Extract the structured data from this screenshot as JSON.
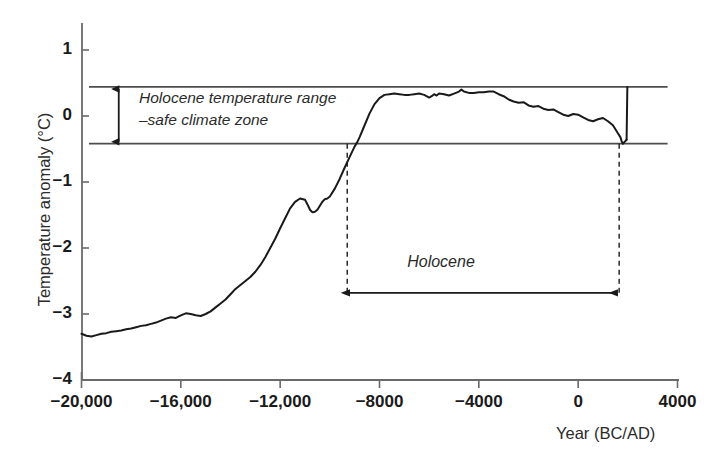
{
  "chart_data": {
    "type": "line",
    "title": "",
    "xlabel": "Year (BC/AD)",
    "ylabel": "Temperature anomaly (°C)",
    "xlim": [
      -20000,
      4000
    ],
    "ylim": [
      -4,
      1.5
    ],
    "xticks": [
      -20000,
      -16000,
      -12000,
      -8000,
      -4000,
      0,
      4000
    ],
    "xtick_labels": [
      "−20,000",
      "−16,000",
      "−12,000",
      "−8000",
      "−4000",
      "0",
      "4000"
    ],
    "yticks": [
      1,
      0,
      -1,
      -2,
      -3,
      -4
    ],
    "ytick_labels": [
      "1",
      "0",
      "−1",
      "−2",
      "−3",
      "−4"
    ],
    "grid": false,
    "legend": null,
    "series": [
      {
        "name": "Global temperature anomaly",
        "color": "#1a1a1a",
        "points": [
          [
            -20000,
            -3.3
          ],
          [
            -19800,
            -3.33
          ],
          [
            -19600,
            -3.34
          ],
          [
            -19400,
            -3.32
          ],
          [
            -19200,
            -3.3
          ],
          [
            -19000,
            -3.29
          ],
          [
            -18800,
            -3.27
          ],
          [
            -18600,
            -3.26
          ],
          [
            -18400,
            -3.25
          ],
          [
            -18200,
            -3.23
          ],
          [
            -18000,
            -3.22
          ],
          [
            -17800,
            -3.2
          ],
          [
            -17600,
            -3.18
          ],
          [
            -17400,
            -3.17
          ],
          [
            -17200,
            -3.15
          ],
          [
            -17000,
            -3.13
          ],
          [
            -16800,
            -3.1
          ],
          [
            -16600,
            -3.07
          ],
          [
            -16400,
            -3.05
          ],
          [
            -16200,
            -3.06
          ],
          [
            -16000,
            -3.02
          ],
          [
            -15800,
            -2.99
          ],
          [
            -15600,
            -3.0
          ],
          [
            -15400,
            -3.02
          ],
          [
            -15200,
            -3.03
          ],
          [
            -15000,
            -3.0
          ],
          [
            -14800,
            -2.96
          ],
          [
            -14600,
            -2.9
          ],
          [
            -14400,
            -2.84
          ],
          [
            -14200,
            -2.78
          ],
          [
            -14000,
            -2.7
          ],
          [
            -13800,
            -2.62
          ],
          [
            -13600,
            -2.56
          ],
          [
            -13400,
            -2.5
          ],
          [
            -13200,
            -2.44
          ],
          [
            -13000,
            -2.36
          ],
          [
            -12800,
            -2.26
          ],
          [
            -12600,
            -2.14
          ],
          [
            -12400,
            -2.0
          ],
          [
            -12200,
            -1.86
          ],
          [
            -12000,
            -1.7
          ],
          [
            -11800,
            -1.55
          ],
          [
            -11600,
            -1.4
          ],
          [
            -11400,
            -1.3
          ],
          [
            -11200,
            -1.25
          ],
          [
            -11000,
            -1.27
          ],
          [
            -10900,
            -1.34
          ],
          [
            -10800,
            -1.42
          ],
          [
            -10700,
            -1.46
          ],
          [
            -10600,
            -1.45
          ],
          [
            -10500,
            -1.42
          ],
          [
            -10400,
            -1.36
          ],
          [
            -10300,
            -1.3
          ],
          [
            -10200,
            -1.26
          ],
          [
            -10100,
            -1.25
          ],
          [
            -10000,
            -1.22
          ],
          [
            -9800,
            -1.1
          ],
          [
            -9600,
            -0.95
          ],
          [
            -9400,
            -0.78
          ],
          [
            -9200,
            -0.62
          ],
          [
            -9000,
            -0.46
          ],
          [
            -8900,
            -0.4
          ],
          [
            -8800,
            -0.32
          ],
          [
            -8600,
            -0.14
          ],
          [
            -8400,
            0.04
          ],
          [
            -8200,
            0.18
          ],
          [
            -8000,
            0.27
          ],
          [
            -7800,
            0.32
          ],
          [
            -7600,
            0.33
          ],
          [
            -7400,
            0.34
          ],
          [
            -7200,
            0.33
          ],
          [
            -7000,
            0.32
          ],
          [
            -6800,
            0.32
          ],
          [
            -6600,
            0.33
          ],
          [
            -6400,
            0.34
          ],
          [
            -6200,
            0.32
          ],
          [
            -6000,
            0.28
          ],
          [
            -5900,
            0.3
          ],
          [
            -5800,
            0.33
          ],
          [
            -5700,
            0.31
          ],
          [
            -5600,
            0.34
          ],
          [
            -5400,
            0.33
          ],
          [
            -5200,
            0.31
          ],
          [
            -5000,
            0.34
          ],
          [
            -4800,
            0.37
          ],
          [
            -4700,
            0.4
          ],
          [
            -4600,
            0.37
          ],
          [
            -4400,
            0.35
          ],
          [
            -4200,
            0.35
          ],
          [
            -4000,
            0.36
          ],
          [
            -3800,
            0.36
          ],
          [
            -3600,
            0.37
          ],
          [
            -3400,
            0.37
          ],
          [
            -3200,
            0.33
          ],
          [
            -3000,
            0.3
          ],
          [
            -2800,
            0.25
          ],
          [
            -2600,
            0.22
          ],
          [
            -2400,
            0.2
          ],
          [
            -2200,
            0.21
          ],
          [
            -2000,
            0.16
          ],
          [
            -1800,
            0.14
          ],
          [
            -1600,
            0.15
          ],
          [
            -1400,
            0.11
          ],
          [
            -1200,
            0.09
          ],
          [
            -1000,
            0.1
          ],
          [
            -800,
            0.06
          ],
          [
            -600,
            0.02
          ],
          [
            -400,
            0.0
          ],
          [
            -200,
            0.03
          ],
          [
            0,
            0.02
          ],
          [
            200,
            -0.02
          ],
          [
            400,
            -0.06
          ],
          [
            600,
            -0.08
          ],
          [
            800,
            -0.05
          ],
          [
            1000,
            -0.03
          ],
          [
            1200,
            -0.08
          ],
          [
            1400,
            -0.14
          ],
          [
            1500,
            -0.2
          ],
          [
            1600,
            -0.26
          ],
          [
            1700,
            -0.32
          ],
          [
            1750,
            -0.38
          ],
          [
            1800,
            -0.42
          ],
          [
            1850,
            -0.4
          ],
          [
            1900,
            -0.38
          ],
          [
            1950,
            -0.36
          ]
        ]
      },
      {
        "name": "Modern warming spike",
        "color": "#1a1a1a",
        "points": [
          [
            1950,
            -0.36
          ],
          [
            1980,
            0.44
          ]
        ]
      }
    ],
    "annotations": [
      {
        "name": "holocene-band-upper",
        "type": "hline",
        "y": 0.44,
        "x_start": -19700,
        "x_end": 3600
      },
      {
        "name": "holocene-band-lower",
        "type": "hline",
        "y": -0.42,
        "x_start": -19700,
        "x_end": 3600
      },
      {
        "name": "holocene-band-arrow",
        "type": "vertical-double-arrow",
        "x": -18500,
        "y_top": 0.44,
        "y_bottom": -0.42
      },
      {
        "name": "holocene-span-arrow",
        "type": "horizontal-double-arrow",
        "x_start": -9300,
        "x_end": 1650,
        "y": -2.68
      },
      {
        "name": "holocene-start-dashed",
        "type": "vline-dashed",
        "x": -9300,
        "y_top": -0.42,
        "y_bottom": -2.68
      },
      {
        "name": "holocene-end-dashed",
        "type": "vline-dashed",
        "x": 1650,
        "y_top": -0.42,
        "y_bottom": -2.68
      }
    ]
  },
  "labels": {
    "y_axis_title": "Temperature anomaly (°C)",
    "x_axis_title": "Year (BC/AD)",
    "band_annotation_line1": "Holocene temperature range",
    "band_annotation_line2": "–safe climate zone",
    "holocene_span_label": "Holocene"
  },
  "colors": {
    "curve": "#1a1a1a",
    "axis": "#6a6a6a",
    "band_line": "#4d4d4d",
    "text": "#1a1a1a",
    "background": "#ffffff"
  }
}
